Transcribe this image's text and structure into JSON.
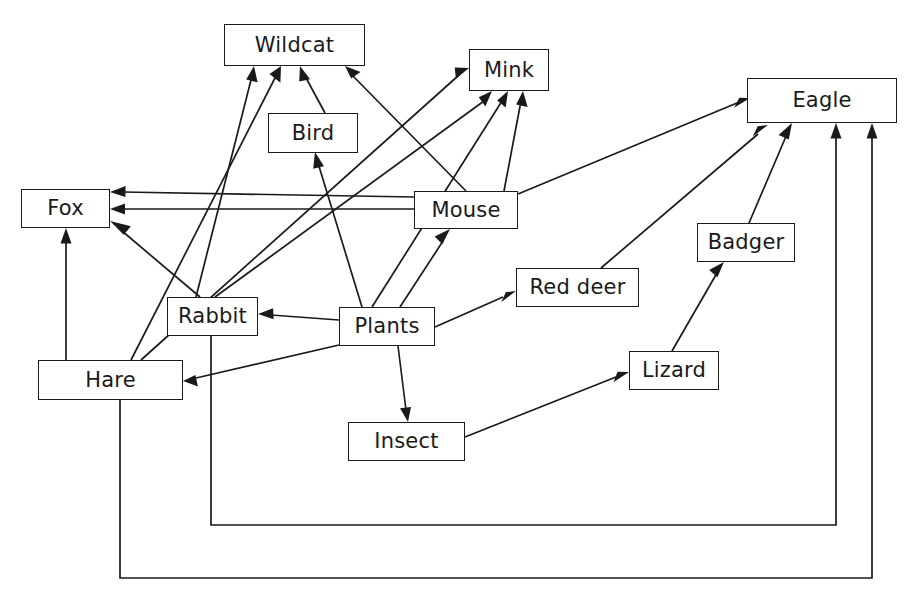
{
  "diagram": {
    "type": "directed-graph",
    "background_color": "#ffffff",
    "line_color": "#1a1a1a",
    "text_color": "#1a1a1a",
    "width": 909,
    "height": 602,
    "nodes": [
      {
        "id": "wildcat",
        "label": "Wildcat",
        "x": 224,
        "y": 24,
        "w": 141,
        "h": 42
      },
      {
        "id": "mink",
        "label": "Mink",
        "x": 469,
        "y": 49,
        "w": 80,
        "h": 42
      },
      {
        "id": "eagle",
        "label": "Eagle",
        "x": 747,
        "y": 78,
        "w": 150,
        "h": 45
      },
      {
        "id": "bird",
        "label": "Bird",
        "x": 268,
        "y": 113,
        "w": 90,
        "h": 40
      },
      {
        "id": "fox",
        "label": "Fox",
        "x": 21,
        "y": 189,
        "w": 89,
        "h": 39
      },
      {
        "id": "mouse",
        "label": "Mouse",
        "x": 414,
        "y": 191,
        "w": 104,
        "h": 38
      },
      {
        "id": "badger",
        "label": "Badger",
        "x": 697,
        "y": 223,
        "w": 98,
        "h": 39
      },
      {
        "id": "reddeer",
        "label": "Red deer",
        "x": 516,
        "y": 268,
        "w": 123,
        "h": 39
      },
      {
        "id": "rabbit",
        "label": "Rabbit",
        "x": 167,
        "y": 297,
        "w": 91,
        "h": 39
      },
      {
        "id": "plants",
        "label": "Plants",
        "x": 339,
        "y": 307,
        "w": 96,
        "h": 39
      },
      {
        "id": "lizard",
        "label": "Lizard",
        "x": 629,
        "y": 351,
        "w": 90,
        "h": 39
      },
      {
        "id": "hare",
        "label": "Hare",
        "x": 38,
        "y": 360,
        "w": 145,
        "h": 40
      },
      {
        "id": "insect",
        "label": "Insect",
        "x": 348,
        "y": 422,
        "w": 117,
        "h": 39
      }
    ],
    "edges": [
      {
        "from": "rabbit",
        "to": "wildcat"
      },
      {
        "from": "hare",
        "to": "wildcat"
      },
      {
        "from": "bird",
        "to": "wildcat"
      },
      {
        "from": "mouse",
        "to": "wildcat"
      },
      {
        "from": "hare",
        "to": "mink"
      },
      {
        "from": "rabbit",
        "to": "mink"
      },
      {
        "from": "plants",
        "to": "mink"
      },
      {
        "from": "mouse",
        "to": "mink"
      },
      {
        "from": "plants",
        "to": "bird"
      },
      {
        "from": "mouse",
        "to": "fox"
      },
      {
        "from": "mouse",
        "to": "fox"
      },
      {
        "from": "rabbit",
        "to": "fox"
      },
      {
        "from": "hare",
        "to": "fox"
      },
      {
        "from": "plants",
        "to": "mouse"
      },
      {
        "from": "plants",
        "to": "rabbit"
      },
      {
        "from": "plants",
        "to": "hare"
      },
      {
        "from": "plants",
        "to": "reddeer"
      },
      {
        "from": "plants",
        "to": "insect"
      },
      {
        "from": "insect",
        "to": "lizard"
      },
      {
        "from": "lizard",
        "to": "badger"
      },
      {
        "from": "badger",
        "to": "eagle"
      },
      {
        "from": "reddeer",
        "to": "eagle"
      },
      {
        "from": "mouse",
        "to": "eagle"
      },
      {
        "from": "rabbit",
        "to": "eagle"
      },
      {
        "from": "hare",
        "to": "eagle"
      }
    ]
  }
}
